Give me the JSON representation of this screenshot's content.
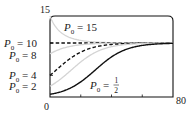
{
  "chart_data": {
    "type": "line",
    "title": "",
    "xlabel": "",
    "ylabel": "",
    "xlim": [
      0,
      80
    ],
    "ylim": [
      0,
      15
    ],
    "x_tick_labels": [
      "0",
      "80"
    ],
    "y_tick_labels": [
      "0",
      "15"
    ],
    "x_minor_ticks": [
      20,
      40,
      60
    ],
    "grid": false,
    "legend": "inline labels on left axis",
    "model": "logistic P(t) = 10 / (1 + ((10 - P0)/P0) e^(-0.1 t))",
    "carrying_capacity": 10,
    "x": [
      0,
      10,
      20,
      30,
      40,
      50,
      60,
      70,
      80
    ],
    "series": [
      {
        "name": "P0 = 15",
        "label_text": "P0 = 15",
        "style": "light-gray solid",
        "values": [
          15.0,
          11.46,
          10.52,
          10.18,
          10.07,
          10.02,
          10.01,
          10.0,
          10.0
        ]
      },
      {
        "name": "P0 = 10",
        "label_text": "P0 = 10",
        "style": "black dashed",
        "values": [
          10,
          10,
          10,
          10,
          10,
          10,
          10,
          10,
          10
        ]
      },
      {
        "name": "P0 = 8",
        "label_text": "P0 = 8",
        "style": "light-gray solid",
        "values": [
          8.0,
          9.16,
          9.67,
          9.88,
          9.95,
          9.98,
          9.99,
          10.0,
          10.0
        ]
      },
      {
        "name": "P0 = 4",
        "label_text": "P0 = 4",
        "style": "black dashed",
        "values": [
          4.0,
          6.44,
          8.31,
          9.31,
          9.73,
          9.9,
          9.96,
          9.99,
          10.0
        ]
      },
      {
        "name": "P0 = 2",
        "label_text": "P0 = 2",
        "style": "light-gray solid",
        "values": [
          2.0,
          4.05,
          6.49,
          8.34,
          9.32,
          9.74,
          9.9,
          9.96,
          9.99
        ]
      },
      {
        "name": "P0 = 1/2",
        "label_text": "P0 = 1/2",
        "style": "black solid",
        "values": [
          0.5,
          1.25,
          2.8,
          5.14,
          7.42,
          8.86,
          9.55,
          9.83,
          9.94
        ]
      }
    ]
  },
  "labels": {
    "y_max": "15",
    "y_min": "0",
    "x_max": "80",
    "p15": {
      "sym": "P",
      "sub": "0",
      "eq": " = 15"
    },
    "p10": {
      "sym": "P",
      "sub": "0",
      "eq": " = 10"
    },
    "p8": {
      "sym": "P",
      "sub": "0",
      "eq": " = 8"
    },
    "p4": {
      "sym": "P",
      "sub": "0",
      "eq": " = 4"
    },
    "p2": {
      "sym": "P",
      "sub": "0",
      "eq": " = 2"
    },
    "phalf": {
      "sym": "P",
      "sub": "0",
      "eq": " = ",
      "num": "1",
      "den": "2"
    }
  }
}
